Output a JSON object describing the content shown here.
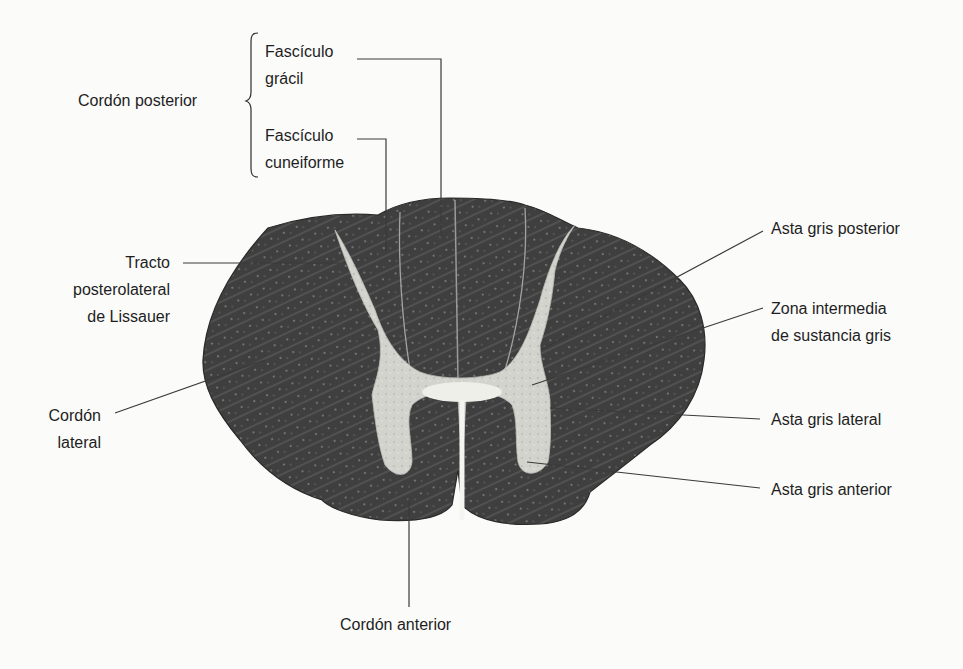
{
  "figure": {
    "labels": {
      "cordon_posterior": "Cordón posterior",
      "fasciculo_gracil": [
        "Fascículo",
        "grácil"
      ],
      "fasciculo_cuneiforme": [
        "Fascículo",
        "cuneiforme"
      ],
      "tracto_lissauer": [
        "Tracto",
        "posterolateral",
        "de Lissauer"
      ],
      "cordon_lateral": [
        "Cordón",
        "lateral"
      ],
      "asta_gris_posterior": "Asta gris posterior",
      "zona_intermedia": [
        "Zona intermedia",
        "de sustancia gris"
      ],
      "asta_gris_lateral": "Asta gris lateral",
      "asta_gris_anterior": "Asta gris anterior",
      "cordon_anterior": "Cordón anterior"
    },
    "colors": {
      "white_matter": "#3f3f3f",
      "gray_matter": "#cfcfc9",
      "leader_line": "#3a3a3a",
      "background": "#fbfbfa"
    }
  }
}
